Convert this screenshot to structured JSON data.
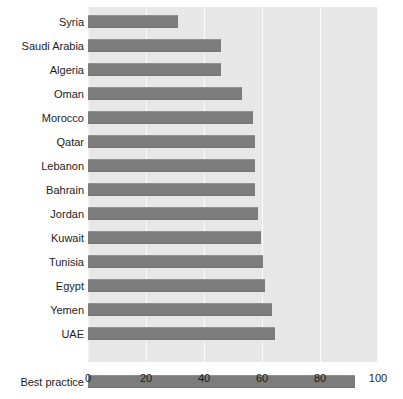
{
  "chart_data": {
    "type": "bar",
    "orientation": "horizontal",
    "title": "",
    "subtitle": "",
    "xlabel": "",
    "ylabel": "",
    "xlim": [
      0,
      100
    ],
    "xticks": [
      0,
      20,
      40,
      60,
      80,
      100
    ],
    "xtick_labels": [
      "0",
      "20",
      "40",
      "60",
      "80",
      "100"
    ],
    "grid": true,
    "grid_axis": "x",
    "legend": false,
    "legend_position": "none",
    "categories": [
      "Syria",
      "Saudi Arabia",
      "Algeria",
      "Oman",
      "Morocco",
      "Qatar",
      "Lebanon",
      "Bahrain",
      "Jordan",
      "Kuwait",
      "Tunisia",
      "Egypt",
      "Yemen",
      "UAE",
      "",
      "Best practice"
    ],
    "values": [
      31,
      46,
      46,
      53,
      57,
      57.5,
      57.5,
      57.5,
      58.5,
      59.5,
      60.5,
      61,
      63.5,
      64.5,
      null,
      92
    ],
    "bars": [
      {
        "label": "Syria",
        "value": 31
      },
      {
        "label": "Saudi Arabia",
        "value": 46
      },
      {
        "label": "Algeria",
        "value": 46
      },
      {
        "label": "Oman",
        "value": 53
      },
      {
        "label": "Morocco",
        "value": 57
      },
      {
        "label": "Qatar",
        "value": 57.5
      },
      {
        "label": "Lebanon",
        "value": 57.5
      },
      {
        "label": "Bahrain",
        "value": 57.5
      },
      {
        "label": "Jordan",
        "value": 58.5
      },
      {
        "label": "Kuwait",
        "value": 59.5
      },
      {
        "label": "Tunisia",
        "value": 60.5
      },
      {
        "label": "Egypt",
        "value": 61
      },
      {
        "label": "Yemen",
        "value": 63.5
      },
      {
        "label": "UAE",
        "value": 64.5
      },
      {
        "label": "",
        "value": null
      },
      {
        "label": "Best practice",
        "value": 92
      }
    ],
    "colors": {
      "bar": "#7c7c7c",
      "plot_background": "#e7e7e7",
      "figure_background": "#ffffff",
      "gridline": "#fbfbfb",
      "text": "#1c1c1c"
    }
  }
}
